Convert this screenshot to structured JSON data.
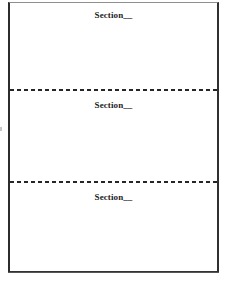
{
  "document": {
    "type": "worksheet-template",
    "background_color": "#ffffff",
    "ink_color": "#1d1d1d",
    "border_color": "#2c2c2c"
  },
  "form": {
    "sections": [
      {
        "label": "Section__",
        "index": 1
      },
      {
        "label": "Section__",
        "index": 2
      },
      {
        "label": "Section__",
        "index": 3
      }
    ],
    "dividers": [
      {
        "style": "dashed"
      },
      {
        "style": "dashed"
      }
    ]
  }
}
